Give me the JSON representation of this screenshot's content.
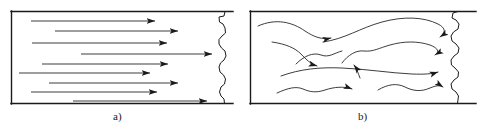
{
  "figure": {
    "background_color": "#ffffff",
    "line_color": "#1a1a1a",
    "width": 482,
    "height": 133
  },
  "panels": [
    {
      "id": "a",
      "caption": "a)",
      "flow_type": "laminar",
      "description": "Straight parallel streamline arrows pointing right inside a pipe section",
      "frame": {
        "x": 11,
        "y": 11,
        "right": 228,
        "bottom": 103
      },
      "arrow_count": 9,
      "arrows": [
        {
          "x1": 31,
          "y1": 21,
          "x2": 155,
          "y2": 21
        },
        {
          "x1": 55,
          "y1": 31,
          "x2": 178,
          "y2": 31
        },
        {
          "x1": 32,
          "y1": 43,
          "x2": 167,
          "y2": 43
        },
        {
          "x1": 81,
          "y1": 54,
          "x2": 212,
          "y2": 54
        },
        {
          "x1": 42,
          "y1": 64,
          "x2": 168,
          "y2": 64
        },
        {
          "x1": 19,
          "y1": 73,
          "x2": 150,
          "y2": 73
        },
        {
          "x1": 49,
          "y1": 83,
          "x2": 178,
          "y2": 83
        },
        {
          "x1": 31,
          "y1": 92,
          "x2": 157,
          "y2": 92
        },
        {
          "x1": 73,
          "y1": 101,
          "x2": 207,
          "y2": 101
        }
      ]
    },
    {
      "id": "b",
      "caption": "b)",
      "flow_type": "turbulent",
      "description": "Wavy, irregular, crossing streamline arrows indicating chaotic eddies inside a pipe section",
      "frame": {
        "x": 250,
        "y": 11,
        "right": 465,
        "bottom": 103
      },
      "arrow_count": 8,
      "streamlines": [
        "upper-left sweeping curve ending mid-panel",
        "long upper arc rising to the right wall",
        "mid-left descending curve with downward arrowhead",
        "serpentine mid-panel curve reaching the right wall",
        "central wavy line crossing the full width",
        "lower long wavy streamline to the right wall",
        "short lower-left hook arrow",
        "bottom undulating streamline to the right wall"
      ]
    }
  ],
  "break_edges": {
    "style": "jagged-wavy-break-line",
    "note": "Right-hand side of each pipe is drawn as a freehand broken/torn edge indicating the pipe continues"
  }
}
